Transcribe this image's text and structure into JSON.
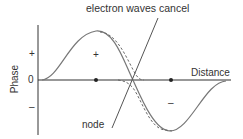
{
  "diagram": {
    "title_label": "electron waves cancel",
    "node_label": "node",
    "x_axis_label": "Distance",
    "y_axis_label": "Phase",
    "y_ticks": {
      "plus": "+",
      "zero": "0",
      "minus": "–"
    },
    "region_signs": {
      "positive": "+",
      "negative": "–"
    },
    "colors": {
      "solid_wave": "#777777",
      "dashed_wave": "#666666",
      "axes": "#333333",
      "text": "#333333"
    }
  }
}
